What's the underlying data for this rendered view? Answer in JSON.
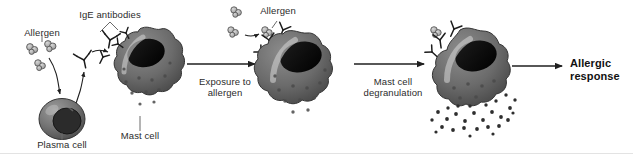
{
  "figure": {
    "background_color": "#ffffff",
    "width": 633,
    "height": 154
  },
  "labels": {
    "allergen_left": "Allergen",
    "ige_antibodies": "IgE antibodies",
    "plasma_cell": "Plasma cell",
    "mast_cell": "Mast cell",
    "allergen_middle": "Allergen",
    "step1": "Exposure to\nallergen",
    "step2": "Mast cell\ndegranulation",
    "outcome": "Allergic\nresponse"
  },
  "colors": {
    "cell_body": "#6e6e6e",
    "cell_body_dark": "#4f4f4f",
    "cell_outline": "#3a3a3a",
    "nucleus": "#141414",
    "highlight": "#c9c9c9",
    "granule": "#3c3c3c",
    "allergen_fill": "#b9b9b9",
    "allergen_stroke": "#4a4a4a",
    "arrow": "#1f1f1f",
    "text": "#2b2b2b",
    "text_bold": "#111111",
    "leader_line": "#6a6a6a"
  },
  "stages": [
    {
      "name": "sensitization",
      "elements": [
        "allergen-cluster",
        "plasma-cell",
        "ige-antibody",
        "mast-cell-resting"
      ]
    },
    {
      "name": "allergen-exposure",
      "elements": [
        "allergen-cluster",
        "ige-antibody",
        "mast-cell-bound"
      ]
    },
    {
      "name": "degranulation",
      "elements": [
        "ige-antibody",
        "mast-cell-degranulating",
        "released-granules"
      ]
    },
    {
      "name": "outcome",
      "elements": [
        "allergic-response-text"
      ]
    }
  ],
  "icons": {
    "arrow": "straight-arrow-right-icon",
    "curved_arrow": "curved-arrow-icon",
    "antibody": "y-shaped-antibody-icon",
    "allergen": "allergen-particle-cluster-icon",
    "cell": "cell-icon"
  }
}
